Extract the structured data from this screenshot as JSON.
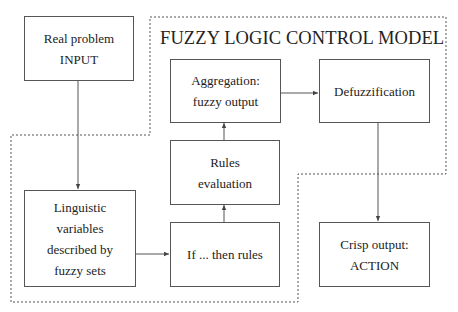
{
  "diagram": {
    "title": "FUZZY LOGIC CONTROL MODEL",
    "nodes": {
      "input": {
        "lines": [
          "Real problem",
          "INPUT"
        ]
      },
      "linguistic": {
        "lines": [
          "Linguistic",
          "variables",
          "described by",
          "fuzzy sets"
        ]
      },
      "rules": {
        "lines": [
          "If ... then rules"
        ]
      },
      "evaluation": {
        "lines": [
          "Rules",
          "evaluation"
        ]
      },
      "aggregation": {
        "lines": [
          "Aggregation:",
          "fuzzy output"
        ]
      },
      "defuzzification": {
        "lines": [
          "Defuzzification"
        ]
      },
      "crisp": {
        "lines": [
          "Crisp output:",
          "ACTION"
        ]
      }
    },
    "edges": [
      {
        "from": "input",
        "to": "linguistic"
      },
      {
        "from": "linguistic",
        "to": "rules"
      },
      {
        "from": "rules",
        "to": "evaluation"
      },
      {
        "from": "evaluation",
        "to": "aggregation"
      },
      {
        "from": "aggregation",
        "to": "defuzzification"
      },
      {
        "from": "defuzzification",
        "to": "crisp"
      }
    ],
    "colors": {
      "line": "#555555",
      "text": "#222222",
      "background": "#ffffff"
    }
  }
}
